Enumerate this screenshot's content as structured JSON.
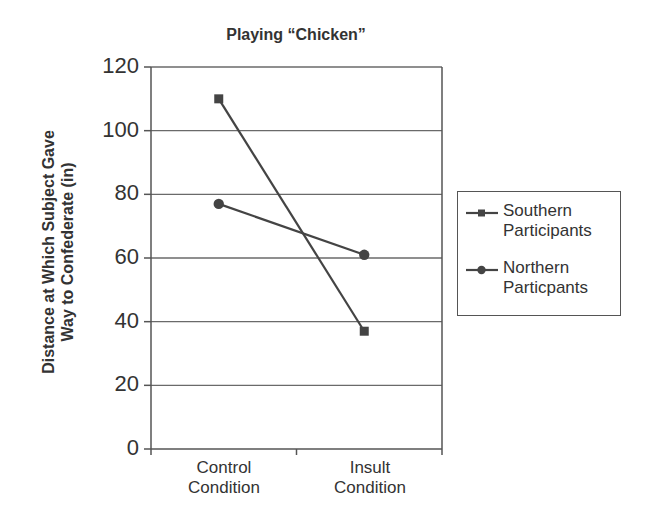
{
  "chart_data": {
    "type": "line",
    "title": "Playing “Chicken”",
    "xlabel": "",
    "ylabel": "Distance at Which Subject Gave Way to Confederate (in)",
    "ylabel_lines": [
      "Distance at Which Subject Gave",
      "Way to Confederate (in)"
    ],
    "categories": [
      "Control Condition",
      "Insult Condition"
    ],
    "category_lines": [
      [
        "Control",
        "Condition"
      ],
      [
        "Insult",
        "Condition"
      ]
    ],
    "series": [
      {
        "name": "Southern Participants",
        "name_lines": [
          "Southern",
          "Participants"
        ],
        "marker": "square",
        "values": [
          110,
          37
        ]
      },
      {
        "name": "Northern Particpants",
        "name_lines": [
          "Northern",
          "Particpants"
        ],
        "marker": "circle",
        "values": [
          77,
          61
        ]
      }
    ],
    "ylim": [
      0,
      120
    ],
    "yticks": [
      "0",
      "20",
      "40",
      "60",
      "80",
      "100",
      "120"
    ],
    "grid": true,
    "legend_position": "right",
    "colors": {
      "line": "#444444",
      "grid": "#666666",
      "text": "#333333"
    }
  }
}
